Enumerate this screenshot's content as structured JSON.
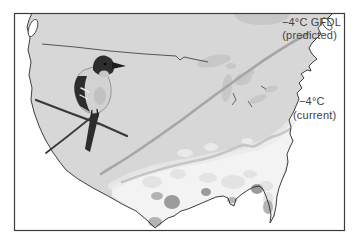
{
  "figure": {
    "kind": "species-range-climate-map",
    "map_region": "continental United States",
    "labels": {
      "predicted": {
        "line1": "−4°C GFDL",
        "line2": "(predicted)"
      },
      "current": {
        "line1": "−4°C",
        "line2": "(current)"
      }
    },
    "isolines": [
      {
        "name": "minus4C-GFDL-predicted",
        "value_c": -4,
        "model": "GFDL",
        "orientation": "northeast-to-southwest across upper Midwest"
      },
      {
        "name": "minus4C-current",
        "value_c": -4,
        "orientation": "mid-Atlantic coast to southern Texas"
      }
    ],
    "icons": {
      "bird": "perched-songbird-illustration"
    },
    "colors": {
      "background": "#ffffff",
      "land": "#d7d7d7",
      "southeast_region": "#f3f3f3",
      "southeast_band": "#e9e9e9",
      "patch_light": "#e3e3e3",
      "lakes": "#c7c7c7",
      "isoline_predicted": "#a6a6a6",
      "isoline_current": "#c6c6c6",
      "dark_patch": "#9b9b9b",
      "mid_patch": "#b3b3b3",
      "coastline": "#2b2b2b",
      "frame": "#3c3c3c",
      "label_text": "#3f3f3f",
      "bird_dark": "#2d2d2d",
      "bird_breast": "#d2d2d2"
    }
  }
}
